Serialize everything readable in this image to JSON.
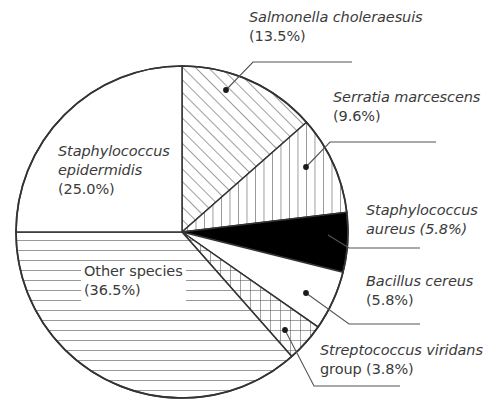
{
  "chart_data": {
    "type": "pie",
    "title": "",
    "subtitle": "",
    "xlabel": "",
    "ylabel": "",
    "legend_position": "none",
    "grid": false,
    "start_angle_deg": 0,
    "direction": "clockwise",
    "units": "percent",
    "total": 100.0,
    "categories": [
      "Salmonella choleraesuis",
      "Serratia marcescens",
      "Staphylococcus aureus",
      "Bacillus cereus",
      "Streptococcus viridans group",
      "Other species",
      "Staphylococcus epidermidis"
    ],
    "values": [
      13.5,
      9.6,
      5.8,
      5.8,
      3.8,
      36.5,
      25.0
    ],
    "slices": [
      {
        "key": "salmonella",
        "species": "Salmonella choleraesuis",
        "percent_text": "(13.5%)",
        "value": 13.5,
        "fill": "diagonal-hatch",
        "label_placement": "outside",
        "italic_species": true
      },
      {
        "key": "serratia",
        "species": "Serratia marcescens",
        "percent_text": "(9.6%)",
        "value": 9.6,
        "fill": "vertical-hatch",
        "label_placement": "outside",
        "italic_species": true
      },
      {
        "key": "staph-aureus",
        "species": "Staphylococcus",
        "species_line2": "aureus (5.8%)",
        "percent_text": "(5.8%)",
        "value": 5.8,
        "fill": "solid-black",
        "label_placement": "outside",
        "italic_species": true
      },
      {
        "key": "bacillus",
        "species": "Bacillus cereus",
        "percent_text": "(5.8%)",
        "value": 5.8,
        "fill": "white",
        "label_placement": "outside",
        "italic_species": true
      },
      {
        "key": "streptococcus",
        "species": "Streptococcus viridans",
        "species_line2": "group (3.8%)",
        "percent_text": "(3.8%)",
        "value": 3.8,
        "fill": "cross-hatch",
        "label_placement": "outside",
        "italic_species": true
      },
      {
        "key": "other",
        "species": "Other species",
        "percent_text": "(36.5%)",
        "value": 36.5,
        "fill": "horizontal-hatch",
        "label_placement": "inside",
        "italic_species": false
      },
      {
        "key": "staph-epidermidis",
        "species": "Staphylococcus",
        "species_line2": "epidermidis",
        "percent_text": "(25.0%)",
        "value": 25.0,
        "fill": "white",
        "label_placement": "inside",
        "italic_species": true
      }
    ]
  },
  "colors": {
    "outline": "#333333",
    "text": "#3b3b3b",
    "solid_slice": "#000000",
    "background": "#ffffff",
    "hatch": "#555555"
  },
  "labels": {
    "salmonella": {
      "species": "Salmonella choleraesuis",
      "percent": "(13.5%)"
    },
    "serratia": {
      "species": "Serratia marcescens",
      "percent": "(9.6%)"
    },
    "staph_aureus": {
      "line1": "Staphylococcus",
      "line2": "aureus (5.8%)"
    },
    "bacillus": {
      "species": "Bacillus cereus",
      "percent": "(5.8%)"
    },
    "streptococcus": {
      "line1": "Streptococcus viridans",
      "line2": "group (3.8%)"
    },
    "epidermidis": {
      "line1": "Staphylococcus",
      "line2": "epidermidis",
      "percent": "(25.0%)"
    },
    "other": {
      "species": "Other species",
      "percent": "(36.5%)"
    }
  }
}
